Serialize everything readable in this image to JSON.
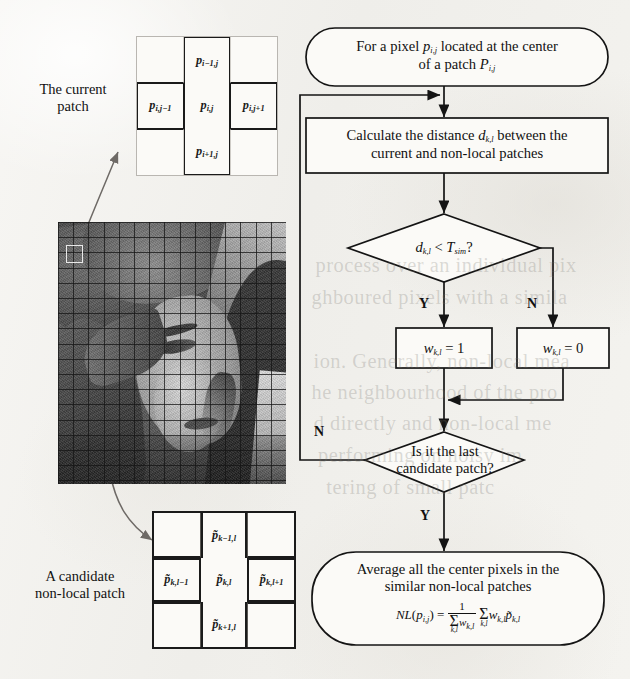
{
  "figure": {
    "background_color": "#f3f2ef",
    "ink_color": "#111111"
  },
  "annotations": {
    "current_patch_label": "The current\npatch",
    "current_patch_label_line1": "The current",
    "current_patch_label_line2": "patch",
    "candidate_patch_label_line1": "A candidate",
    "candidate_patch_label_line2": "non-local patch"
  },
  "current_patch_grid": {
    "name": "current-patch",
    "cells": [
      {
        "pos": "top-left",
        "label": "",
        "highlighted": false
      },
      {
        "pos": "top-center",
        "label": "p",
        "sub": "i-1,j",
        "highlighted": true
      },
      {
        "pos": "top-right",
        "label": "",
        "highlighted": false
      },
      {
        "pos": "mid-left",
        "label": "p",
        "sub": "i,j-1",
        "highlighted": true
      },
      {
        "pos": "center",
        "label": "p",
        "sub": "i,j",
        "highlighted": true
      },
      {
        "pos": "mid-right",
        "label": "p",
        "sub": "i,j+1",
        "highlighted": true
      },
      {
        "pos": "bottom-left",
        "label": "",
        "highlighted": false
      },
      {
        "pos": "bottom-center",
        "label": "p",
        "sub": "i+1,j",
        "highlighted": true
      },
      {
        "pos": "bottom-right",
        "label": "",
        "highlighted": false
      }
    ]
  },
  "candidate_patch_grid": {
    "name": "candidate-non-local-patch",
    "cells": [
      {
        "pos": "top-left",
        "label": "",
        "highlighted": false
      },
      {
        "pos": "top-center",
        "label": "p̃",
        "sub": "k-1,l",
        "highlighted": true
      },
      {
        "pos": "top-right",
        "label": "",
        "highlighted": false
      },
      {
        "pos": "mid-left",
        "label": "p̃",
        "sub": "k,l-1",
        "highlighted": true
      },
      {
        "pos": "center",
        "label": "p̃",
        "sub": "k,l",
        "highlighted": true
      },
      {
        "pos": "mid-right",
        "label": "p̃",
        "sub": "k,l+1",
        "highlighted": true
      },
      {
        "pos": "bottom-left",
        "label": "",
        "highlighted": false
      },
      {
        "pos": "bottom-center",
        "label": "p̃",
        "sub": "k+1,l",
        "highlighted": true
      },
      {
        "pos": "bottom-right",
        "label": "",
        "highlighted": false
      }
    ]
  },
  "image_panel": {
    "name": "lena-sample-image",
    "description": "grayscale photograph with search-window grid overlay",
    "selection_marker": "white square highlighting the current patch"
  },
  "flowchart": {
    "start": {
      "shape": "rounded",
      "line1_a": "For a pixel ",
      "line1_p": "p",
      "line1_p_sub": "i,j",
      "line1_b": " located at the center",
      "line2_a": "of a patch ",
      "line2_P": "P",
      "line2_P_sub": "i,j"
    },
    "calculate": {
      "shape": "rect",
      "line1_a": "Calculate the distance ",
      "line1_d": "d",
      "line1_d_sub": "k,l",
      "line1_b": " between the",
      "line2": "current and non-local patches"
    },
    "decision_sim": {
      "shape": "diamond",
      "d": "d",
      "d_sub": "k,l",
      "op": " < ",
      "T": "T",
      "T_sub": "sim",
      "q": "?",
      "yes": "Y",
      "no": "N"
    },
    "weight_one": {
      "shape": "rect",
      "w": "w",
      "w_sub": "k,l",
      "eq": " = 1"
    },
    "weight_zero": {
      "shape": "rect",
      "w": "w",
      "w_sub": "k,l",
      "eq": " = 0"
    },
    "decision_last": {
      "shape": "diamond",
      "line1": "Is it the last",
      "line2": "candidate patch?",
      "yes": "Y",
      "no": "N"
    },
    "average": {
      "shape": "rounded",
      "line1": "Average all the center pixels in the",
      "line2": "similar non-local patches",
      "formula": {
        "lhs_NL": "NL",
        "lhs_open": "(",
        "lhs_p": "p",
        "lhs_p_sub": "i,j",
        "lhs_close": ")",
        "eq": " = ",
        "frac_num": "1",
        "frac_den_sigma": "Σ",
        "frac_den_under": "k,l",
        "frac_den_w": "w",
        "frac_den_w_sub": "k,l",
        "sum_sigma": "Σ",
        "sum_under": "k,l",
        "term_w": "w",
        "term_w_sub": "k,l",
        "term_p": "p̃",
        "term_p_sub": "k,l"
      }
    }
  },
  "bleed_through_text": [
    "process over an individual pix",
    "ghboured pixels with a simila",
    "ion. Generally, non-local mea",
    "he neighbourhood of the pro",
    "d directly and non-local me",
    "performing on noisy im",
    "tering of small patc"
  ]
}
